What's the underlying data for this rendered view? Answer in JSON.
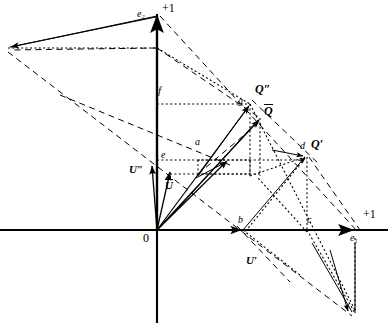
{
  "figure": {
    "canvas": {
      "width": 388,
      "height": 323,
      "background": "#ffffff"
    },
    "stroke_color": "#000000",
    "axes": {
      "origin_label": "0",
      "origin_px": {
        "x": 157,
        "y": 230
      },
      "horizontal_axis": {
        "y": 230,
        "x_start": 0,
        "x_end": 388
      },
      "vertical_axis": {
        "x": 157,
        "y_start": 14,
        "y_end": 323
      },
      "x_unit_label": "+1",
      "y_unit_label": "+1",
      "x_basis_label": "e",
      "x_basis_sub": "1",
      "y_basis_label": "e",
      "y_basis_sub": "2"
    },
    "labels": [
      {
        "id": "y-unit",
        "text": "+1",
        "x": 162,
        "y": 3,
        "size": 11,
        "style": "roman"
      },
      {
        "id": "e2",
        "text": "e",
        "sub": "2",
        "x": 138,
        "y": 10,
        "size": 9,
        "style": "italic"
      },
      {
        "id": "f",
        "text": "f",
        "x": 158,
        "y": 87,
        "size": 10,
        "style": "italic"
      },
      {
        "id": "g",
        "text": "g",
        "x": 240,
        "y": 97,
        "size": 9,
        "style": "italic"
      },
      {
        "id": "Q-double-prime",
        "text": "Q″",
        "x": 256,
        "y": 85,
        "size": 11,
        "style": "bold-italic"
      },
      {
        "id": "Q-bar",
        "text": "Q",
        "overbar": true,
        "x": 265,
        "y": 104,
        "size": 11,
        "style": "bold-italic"
      },
      {
        "id": "a",
        "text": "a",
        "x": 196,
        "y": 138,
        "size": 9,
        "style": "italic"
      },
      {
        "id": "e",
        "text": "e",
        "x": 161,
        "y": 152,
        "size": 9,
        "style": "italic"
      },
      {
        "id": "d",
        "text": "d",
        "x": 303,
        "y": 142,
        "size": 9,
        "style": "italic"
      },
      {
        "id": "Q-prime",
        "text": "Q′",
        "x": 313,
        "y": 140,
        "size": 11,
        "style": "bold-italic"
      },
      {
        "id": "U-double-prime",
        "text": "U″",
        "x": 131,
        "y": 165,
        "size": 10,
        "style": "bold-italic"
      },
      {
        "id": "U-bar",
        "text": "U",
        "overbar": true,
        "x": 165,
        "y": 180,
        "size": 10,
        "style": "bold-italic"
      },
      {
        "id": "origin",
        "text": "0",
        "x": 144,
        "y": 234,
        "size": 11,
        "style": "roman"
      },
      {
        "id": "b",
        "text": "b",
        "x": 238,
        "y": 216,
        "size": 9,
        "style": "italic"
      },
      {
        "id": "c",
        "text": "c",
        "x": 307,
        "y": 216,
        "size": 9,
        "style": "italic"
      },
      {
        "id": "x-unit",
        "text": "+1",
        "x": 364,
        "y": 210,
        "size": 11,
        "style": "roman"
      },
      {
        "id": "e1",
        "text": "e",
        "sub": "1",
        "x": 352,
        "y": 233,
        "size": 9,
        "style": "italic"
      },
      {
        "id": "U-prime",
        "text": "U′",
        "x": 247,
        "y": 256,
        "size": 10,
        "style": "bold-italic"
      }
    ],
    "points": {
      "O": {
        "x": 157,
        "y": 230
      },
      "Q_double_prime": {
        "x": 250,
        "y": 104
      },
      "Q_bar": {
        "x": 260,
        "y": 118
      },
      "Q_prime": {
        "x": 307,
        "y": 155
      },
      "g": {
        "x": 250,
        "y": 104
      },
      "f": {
        "x": 157,
        "y": 104
      },
      "e": {
        "x": 157,
        "y": 160
      },
      "a": {
        "x": 228,
        "y": 160
      },
      "d": {
        "x": 307,
        "y": 160
      },
      "b": {
        "x": 243,
        "y": 230
      },
      "c": {
        "x": 307,
        "y": 230
      },
      "e1_tip": {
        "x": 355,
        "y": 230
      },
      "e2_tip": {
        "x": 157,
        "y": 14
      },
      "upper_left_tip": {
        "x": 8,
        "y": 48
      },
      "bottom_right_tip": {
        "x": 355,
        "y": 313
      },
      "box_low_right": {
        "x": 250,
        "y": 174
      },
      "box_low_left": {
        "x": 198,
        "y": 174
      }
    },
    "line_styles": {
      "solid": "solid vector / axis",
      "dashed_long": "long-dashed construction line",
      "dotted": "fine dotted projection line"
    }
  }
}
